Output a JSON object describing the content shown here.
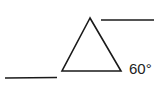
{
  "diagram": {
    "type": "geometry",
    "stroke_color": "#1a1a1a",
    "triangle": {
      "vertices": {
        "apex": [
          90,
          18
        ],
        "bottom_left": [
          62,
          71
        ],
        "bottom_right": [
          121,
          71
        ]
      }
    },
    "lines": [
      {
        "name": "upper-right-line",
        "from": [
          101,
          20
        ],
        "to": [
          154,
          20
        ]
      },
      {
        "name": "lower-left-line",
        "from": [
          5,
          78
        ],
        "to": [
          57,
          77
        ]
      }
    ],
    "labels": {
      "angle": "60°"
    }
  }
}
